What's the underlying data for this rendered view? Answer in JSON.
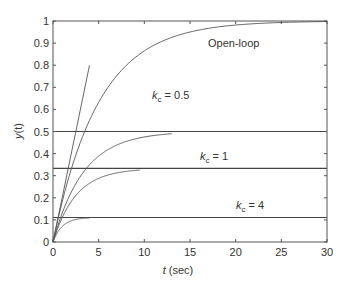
{
  "chart_data": {
    "type": "line",
    "title": "",
    "xlabel": "t (sec)",
    "xlabel_italic_part": "t",
    "xlabel_rest": " (sec)",
    "ylabel": "y(t)",
    "xlim": [
      0,
      30
    ],
    "ylim": [
      0,
      1
    ],
    "grid": false,
    "legend": "none (inline annotations)",
    "xticks": [
      0,
      5,
      10,
      15,
      20,
      25,
      30
    ],
    "yticks": [
      0,
      0.1,
      0.2,
      0.3,
      0.4,
      0.5,
      0.6,
      0.7,
      0.8,
      0.9,
      1
    ],
    "series": [
      {
        "name": "Open-loop",
        "kind": "first-order step response",
        "gain": 1.0,
        "time_constant": 5.0,
        "t_end": 30,
        "x": [
          0,
          1,
          2,
          3,
          4,
          5,
          6,
          8,
          10,
          12,
          15,
          20,
          25,
          30
        ],
        "values": [
          0,
          0.18,
          0.33,
          0.45,
          0.55,
          0.63,
          0.7,
          0.8,
          0.86,
          0.91,
          0.95,
          0.98,
          0.99,
          1.0
        ]
      },
      {
        "name": "k_c = 0.5",
        "kind": "closed-loop step response",
        "gain": 0.5,
        "time_constant": 3.33,
        "t_end": 13,
        "x": [
          0,
          1,
          2,
          3,
          4,
          6,
          8,
          10,
          13
        ],
        "values": [
          0,
          0.13,
          0.23,
          0.3,
          0.35,
          0.42,
          0.46,
          0.48,
          0.49
        ]
      },
      {
        "name": "k_c = 1",
        "kind": "closed-loop step response",
        "gain": 0.333,
        "time_constant": 2.5,
        "t_end": 9.5,
        "x": [
          0,
          1,
          2,
          3,
          4,
          6,
          8,
          9.5
        ],
        "values": [
          0,
          0.11,
          0.18,
          0.23,
          0.27,
          0.3,
          0.32,
          0.33
        ]
      },
      {
        "name": "k_c = 4",
        "kind": "closed-loop step response",
        "gain": 0.111,
        "time_constant": 1.0,
        "t_end": 4,
        "x": [
          0,
          0.5,
          1,
          2,
          3,
          4
        ],
        "values": [
          0,
          0.044,
          0.07,
          0.096,
          0.105,
          0.109
        ]
      },
      {
        "name": "Ramp (initial slope)",
        "kind": "straight line",
        "x": [
          0,
          4
        ],
        "values": [
          0,
          0.8
        ]
      }
    ],
    "reference_lines": [
      {
        "label": "k_c = 0.5",
        "y": 0.5
      },
      {
        "label": "k_c = 1",
        "y": 0.333
      },
      {
        "label": "k_c = 4",
        "y": 0.111
      }
    ],
    "annotations": [
      {
        "text": "Open-loop",
        "t": 17,
        "y": 0.89
      },
      {
        "text": "k_c = 0.5",
        "t": 11,
        "y": 0.54
      },
      {
        "text": "k_c = 1",
        "t": 16,
        "y": 0.37
      },
      {
        "text": "k_c = 4",
        "t": 20,
        "y": 0.15
      }
    ]
  },
  "labels": {
    "open_loop": "Open-loop",
    "kc_symbol": "k",
    "kc_sub": "c",
    "kc05_value": " = 0.5",
    "kc1_value": " = 1",
    "kc4_value": " = 4",
    "ylabel_y": "y",
    "ylabel_t": "(t)",
    "xlabel_t": "t",
    "xlabel_rest": " (sec)"
  },
  "colors": {
    "axes": "#555555",
    "curve": "#555555",
    "reference": "#444444",
    "text": "#333333"
  }
}
